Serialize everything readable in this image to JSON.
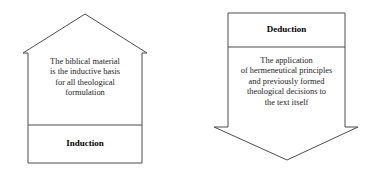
{
  "diagram": {
    "stroke_color": "#4d4d4d",
    "fill_color": "#ffffff",
    "text_color": "#1c1c1c",
    "figures": [
      {
        "id": "induction",
        "shape": "upward-pentagon-house",
        "label": "Induction",
        "label_position": "bottom",
        "body_lines": [
          "The biblical material",
          "is the inductive basis",
          "for all theological",
          "formulation"
        ]
      },
      {
        "id": "deduction",
        "shape": "downward-arrow-pentagon",
        "label": "Deduction",
        "label_position": "top",
        "body_lines": [
          "The application",
          "of hermeneutical principles",
          "and previously formed",
          "theological decisions to",
          "the text itself"
        ]
      }
    ]
  }
}
